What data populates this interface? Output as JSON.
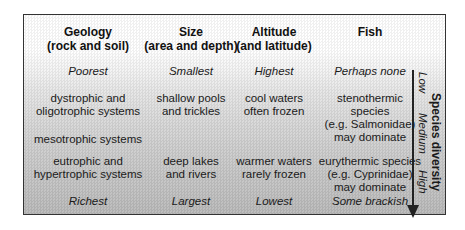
{
  "columns": [
    {
      "title": "Geology",
      "subtitle": "(rock and soil)"
    },
    {
      "title": "Size",
      "subtitle": "(area and depth)"
    },
    {
      "title": "Altitude",
      "subtitle": "(and latitude)"
    },
    {
      "title": "Fish",
      "subtitle": ""
    }
  ],
  "rows": {
    "top": {
      "geology": "Poorest",
      "size": "Smallest",
      "altitude": "Highest",
      "fish": "Perhaps none"
    },
    "low": {
      "geology": [
        "dystrophic and",
        "oligotrophic systems"
      ],
      "size": [
        "shallow pools",
        "and trickles"
      ],
      "altitude": [
        "cool waters",
        "often frozen"
      ],
      "fish": [
        "stenothermic",
        "species",
        "(e.g. Salmonidae)",
        "may dominate"
      ]
    },
    "mid": {
      "geology": "mesotrophic systems"
    },
    "high": {
      "geology": [
        "eutrophic and",
        "hypertrophic systems"
      ],
      "size": [
        "deep lakes",
        "and rivers"
      ],
      "altitude": [
        "warmer waters",
        "rarely frozen"
      ],
      "fish": [
        "eurythermic species",
        "(e.g. Cyprinidae)",
        "may dominate"
      ]
    },
    "bottom": {
      "geology": "Richest",
      "size": "Largest",
      "altitude": "Lowest",
      "fish": "Some brackish"
    }
  },
  "axis": {
    "title": "Species diversity",
    "levels": [
      "Low",
      "Medium",
      "High"
    ]
  }
}
